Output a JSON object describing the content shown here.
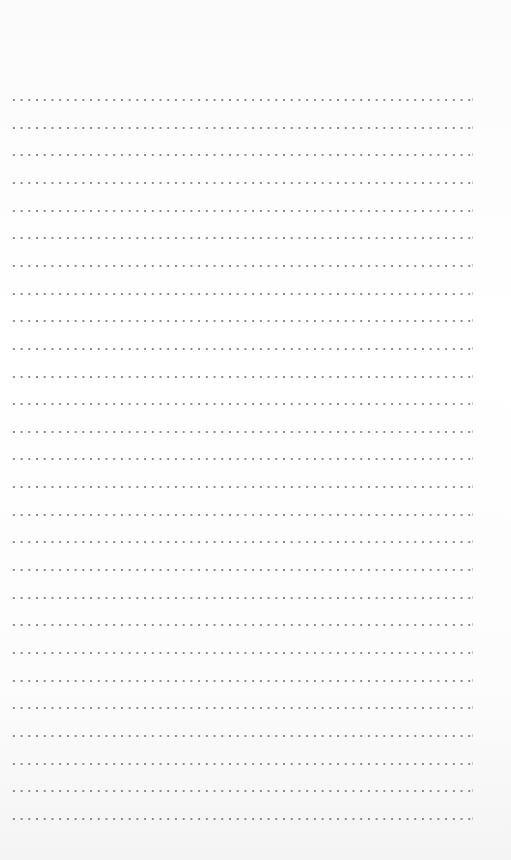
{
  "page": {
    "type": "dotted-lined-paper",
    "background_color": "#fdfdfd",
    "dot_color": "#8a8a8a",
    "line_count": 27,
    "first_line_y": 100,
    "line_spacing": 27.65,
    "line_left": 10,
    "line_width": 461
  }
}
